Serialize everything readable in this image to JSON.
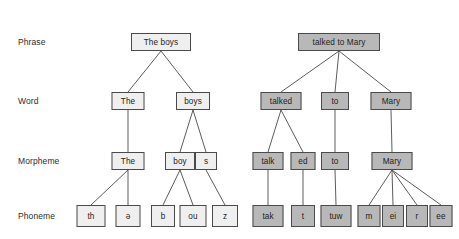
{
  "diagram": {
    "background": "#ffffff",
    "edge_color": "#4a4a4a",
    "box_border": "#4a4a4a",
    "fill_light": "#efefef",
    "fill_dark": "#b8b8b8"
  },
  "levels": [
    {
      "label": "Phrase",
      "y": 42
    },
    {
      "label": "Word",
      "y": 101
    },
    {
      "label": "Morpheme",
      "y": 161
    },
    {
      "label": "Phoneme",
      "y": 216
    }
  ],
  "trees": [
    {
      "name": "the-boys",
      "fill": "light",
      "phrase": "The boys",
      "words": [
        "The",
        "boys"
      ],
      "morphemes": [
        "The",
        "boy",
        "s"
      ],
      "phonemes": [
        "th",
        "ə",
        "b",
        "ou",
        "z"
      ]
    },
    {
      "name": "talked-to-mary",
      "fill": "dark",
      "phrase": "talked to Mary",
      "words": [
        "talked",
        "to",
        "Mary"
      ],
      "morphemes": [
        "talk",
        "ed",
        "to",
        "Mary"
      ],
      "phonemes": [
        "tak",
        "t",
        "tuw",
        "m",
        "ei",
        "r",
        "ee"
      ]
    }
  ],
  "nodes": {
    "l_phrase": {
      "text": "The boys",
      "x": 161,
      "y": 42,
      "w": 60,
      "h": 18,
      "fill": "light"
    },
    "l_w_the": {
      "text": "The",
      "x": 128,
      "y": 101,
      "w": 33,
      "h": 18,
      "fill": "light"
    },
    "l_w_boys": {
      "text": "boys",
      "x": 193,
      "y": 101,
      "w": 34,
      "h": 18,
      "fill": "light"
    },
    "l_m_the": {
      "text": "The",
      "x": 128,
      "y": 161,
      "w": 33,
      "h": 18,
      "fill": "light"
    },
    "l_m_boy": {
      "text": "boy",
      "x": 180,
      "y": 161,
      "w": 30,
      "h": 18,
      "fill": "light"
    },
    "l_m_s": {
      "text": "s",
      "x": 206,
      "y": 161,
      "w": 22,
      "h": 18,
      "fill": "light"
    },
    "l_p_th": {
      "text": "th",
      "x": 91,
      "y": 216,
      "w": 29,
      "h": 22,
      "fill": "light"
    },
    "l_p_schwa": {
      "text": "ə",
      "x": 128,
      "y": 216,
      "w": 25,
      "h": 22,
      "fill": "light"
    },
    "l_p_b": {
      "text": "b",
      "x": 163,
      "y": 216,
      "w": 24,
      "h": 22,
      "fill": "light"
    },
    "l_p_ou": {
      "text": "ou",
      "x": 193,
      "y": 216,
      "w": 27,
      "h": 22,
      "fill": "light"
    },
    "l_p_z": {
      "text": "z",
      "x": 225,
      "y": 216,
      "w": 26,
      "h": 22,
      "fill": "light"
    },
    "r_phrase": {
      "text": "talked to Mary",
      "x": 339,
      "y": 42,
      "w": 82,
      "h": 18,
      "fill": "dark"
    },
    "r_w_talked": {
      "text": "talked",
      "x": 281,
      "y": 101,
      "w": 41,
      "h": 18,
      "fill": "dark"
    },
    "r_w_to": {
      "text": "to",
      "x": 335,
      "y": 101,
      "w": 28,
      "h": 18,
      "fill": "dark"
    },
    "r_w_mary": {
      "text": "Mary",
      "x": 391,
      "y": 101,
      "w": 41,
      "h": 18,
      "fill": "dark"
    },
    "r_m_talk": {
      "text": "talk",
      "x": 268,
      "y": 161,
      "w": 31,
      "h": 18,
      "fill": "dark"
    },
    "r_m_ed": {
      "text": "ed",
      "x": 303,
      "y": 161,
      "w": 25,
      "h": 18,
      "fill": "dark"
    },
    "r_m_to": {
      "text": "to",
      "x": 335,
      "y": 161,
      "w": 28,
      "h": 18,
      "fill": "dark"
    },
    "r_m_mary": {
      "text": "Mary",
      "x": 392,
      "y": 161,
      "w": 41,
      "h": 18,
      "fill": "dark"
    },
    "r_p_tak": {
      "text": "tak",
      "x": 268,
      "y": 216,
      "w": 31,
      "h": 22,
      "fill": "dark"
    },
    "r_p_t": {
      "text": "t",
      "x": 303,
      "y": 216,
      "w": 24,
      "h": 22,
      "fill": "dark"
    },
    "r_p_tuw": {
      "text": "tuw",
      "x": 336,
      "y": 216,
      "w": 31,
      "h": 22,
      "fill": "dark"
    },
    "r_p_m": {
      "text": "m",
      "x": 369,
      "y": 216,
      "w": 23,
      "h": 22,
      "fill": "dark"
    },
    "r_p_ei": {
      "text": "ei",
      "x": 393,
      "y": 216,
      "w": 22,
      "h": 22,
      "fill": "dark"
    },
    "r_p_r": {
      "text": "r",
      "x": 417,
      "y": 216,
      "w": 22,
      "h": 22,
      "fill": "dark"
    },
    "r_p_ee": {
      "text": "ee",
      "x": 441,
      "y": 216,
      "w": 23,
      "h": 22,
      "fill": "dark"
    }
  },
  "edges": [
    {
      "from": "l_phrase",
      "to": "l_w_the"
    },
    {
      "from": "l_phrase",
      "to": "l_w_boys"
    },
    {
      "from": "l_w_the",
      "to": "l_m_the"
    },
    {
      "from": "l_w_boys",
      "to": "l_m_boy"
    },
    {
      "from": "l_w_boys",
      "to": "l_m_s"
    },
    {
      "from": "l_m_the",
      "to": "l_p_th"
    },
    {
      "from": "l_m_the",
      "to": "l_p_schwa"
    },
    {
      "from": "l_m_boy",
      "to": "l_p_b"
    },
    {
      "from": "l_m_boy",
      "to": "l_p_ou"
    },
    {
      "from": "l_m_s",
      "to": "l_p_z"
    },
    {
      "from": "r_phrase",
      "to": "r_w_talked"
    },
    {
      "from": "r_phrase",
      "to": "r_w_to"
    },
    {
      "from": "r_phrase",
      "to": "r_w_mary"
    },
    {
      "from": "r_w_talked",
      "to": "r_m_talk"
    },
    {
      "from": "r_w_talked",
      "to": "r_m_ed"
    },
    {
      "from": "r_w_to",
      "to": "r_m_to"
    },
    {
      "from": "r_w_mary",
      "to": "r_m_mary"
    },
    {
      "from": "r_m_talk",
      "to": "r_p_tak"
    },
    {
      "from": "r_m_ed",
      "to": "r_p_t"
    },
    {
      "from": "r_m_to",
      "to": "r_p_tuw"
    },
    {
      "from": "r_m_mary",
      "to": "r_p_m"
    },
    {
      "from": "r_m_mary",
      "to": "r_p_ei"
    },
    {
      "from": "r_m_mary",
      "to": "r_p_r"
    },
    {
      "from": "r_m_mary",
      "to": "r_p_ee"
    }
  ],
  "row_label_x": 18
}
